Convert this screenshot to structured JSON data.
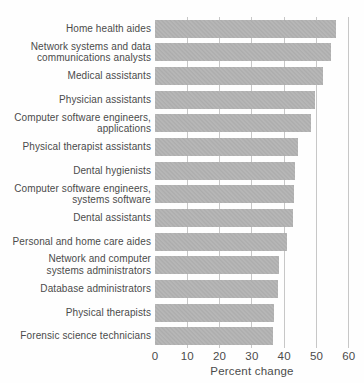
{
  "chart_data": {
    "type": "bar",
    "orientation": "horizontal",
    "title": "",
    "xlabel": "Percent change",
    "ylabel": "",
    "categories": [
      "Home health aides",
      "Network systems and data\ncommunications analysts",
      "Medical assistants",
      "Physician assistants",
      "Computer software engineers,\napplications",
      "Physical therapist assistants",
      "Dental hygienists",
      "Computer software engineers,\nsystems software",
      "Dental assistants",
      "Personal and home care aides",
      "Network and computer\nsystems administrators",
      "Database administrators",
      "Physical therapists",
      "Forensic science technicians"
    ],
    "values": [
      56.0,
      54.6,
      52.1,
      49.6,
      48.4,
      44.2,
      43.3,
      43.0,
      42.7,
      41.0,
      38.4,
      38.2,
      36.7,
      36.4
    ],
    "xlim": [
      0,
      60
    ],
    "xticks": [
      0,
      10,
      20,
      30,
      40,
      50,
      60
    ],
    "xtick_labels": [
      "0",
      "10",
      "20",
      "30",
      "40",
      "50",
      "60"
    ],
    "grid": "vertical-only",
    "legend": "none",
    "colors": {
      "bar": "#b2b2b2",
      "gridline": "#c7c7c7",
      "text": "#4b4b4b",
      "background": "#fefefe"
    }
  }
}
